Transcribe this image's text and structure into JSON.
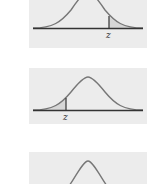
{
  "figure": {
    "background": "#ffffff",
    "panel_background": "#ececec",
    "curve_color": "#777777",
    "axis_color": "#333333",
    "shade_color": "#d6d6d6",
    "panels": [
      {
        "label": "z",
        "shaded_tail": "right",
        "description": "Normal curve with area to the right of z shaded"
      },
      {
        "label": "z",
        "shaded_tail": "left",
        "description": "Normal curve with area to the left of z shaded"
      },
      {
        "label": "",
        "shaded_tail": "none",
        "description": "Normal curve (partially visible)"
      }
    ]
  }
}
